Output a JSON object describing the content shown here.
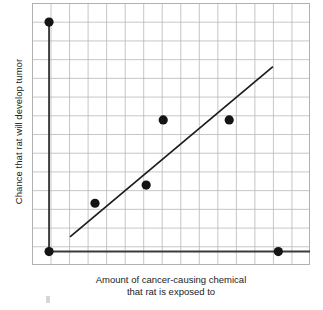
{
  "chart_data": {
    "type": "scatter",
    "title": "",
    "subtitle": "",
    "xlabel_line1": "Amount of cancer-causing chemical",
    "xlabel_line2": "that rat is exposed to",
    "ylabel": "Chance that rat will develop tumor",
    "xlim": [
      0,
      15
    ],
    "ylim": [
      0,
      14
    ],
    "xticks": [
      0,
      1,
      2,
      3,
      4,
      5,
      6,
      7,
      8,
      9,
      10,
      11,
      12,
      13,
      14,
      15
    ],
    "yticks": [
      0,
      1,
      2,
      3,
      4,
      5,
      6,
      7,
      8,
      9,
      10,
      11,
      12,
      13,
      14
    ],
    "xticklabels": [],
    "yticklabels": [],
    "grid": true,
    "legend": false,
    "legend_position": "none",
    "marker": "filled-circle",
    "marker_color": "#141414",
    "marker_size_px": 4.6,
    "grid_color": "#b8b8b8",
    "axis_color": "#3a3a3a",
    "trendline_color": "#1c1c1c",
    "n_points": 6,
    "points": [
      {
        "x": 0.92,
        "y": 12.98,
        "label": "point-1"
      },
      {
        "x": 0.92,
        "y": 0.72,
        "label": "point-2"
      },
      {
        "x": 3.4,
        "y": 3.3,
        "label": "point-3"
      },
      {
        "x": 6.16,
        "y": 4.27,
        "label": "point-4"
      },
      {
        "x": 7.08,
        "y": 7.75,
        "label": "point-5"
      },
      {
        "x": 10.64,
        "y": 7.75,
        "label": "point-6"
      },
      {
        "x": 13.29,
        "y": 0.72,
        "label": "point-7"
      }
    ],
    "trendline": {
      "name": "line of best fit",
      "x0": 2.05,
      "y0": 1.5,
      "x1": 13.0,
      "y1": 10.6
    },
    "axis_overlays": [
      {
        "name": "vertical-axis-segment",
        "x0": 0.92,
        "y0": 13.0,
        "x1": 0.92,
        "y1": 0.72
      },
      {
        "name": "horizontal-axis-segment",
        "x0": 0.92,
        "y0": 0.72,
        "x1": 15.0,
        "y1": 0.72
      }
    ]
  },
  "figure": {
    "xlabel_line1": "Amount of cancer-causing chemical",
    "xlabel_line2": "that rat is exposed to",
    "ylabel": "Chance that rat will develop tumor"
  }
}
